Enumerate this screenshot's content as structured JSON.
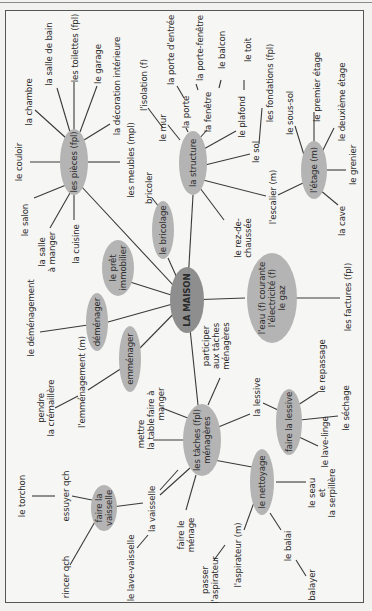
{
  "diagram": {
    "title": "LA MAISON",
    "orientation": "rotated -90deg (text reads bottom-to-top)",
    "colors": {
      "node_fill": "#b4b4b4",
      "center_fill": "#8e8e8e",
      "line": "#3a3a3a",
      "frame": "#555555"
    },
    "center": {
      "label": "LA MAISON",
      "x": 187,
      "y": 300
    },
    "nodes": [
      {
        "id": "pieces",
        "label": "les pièces (fpl)",
        "x": 74,
        "y": 162
      },
      {
        "id": "structure",
        "label": "la structure",
        "x": 193,
        "y": 163
      },
      {
        "id": "etage",
        "label": "l'étage (m)",
        "x": 314,
        "y": 170
      },
      {
        "id": "bricolage",
        "label": "le bricolage",
        "x": 163,
        "y": 230
      },
      {
        "id": "pret",
        "label": "le prêt\nimmobilier",
        "x": 118,
        "y": 268
      },
      {
        "id": "demenager",
        "label": "déménager",
        "x": 97,
        "y": 322
      },
      {
        "id": "emmenager",
        "label": "emménager",
        "x": 130,
        "y": 359
      },
      {
        "id": "eau",
        "label": "l'eau (f) courante\nl'électricité (f)\nle gaz",
        "x": 272,
        "y": 298
      },
      {
        "id": "taches",
        "label": "les tâches (fpl)\nménagères",
        "x": 202,
        "y": 440
      },
      {
        "id": "lessive",
        "label": "faire la lessive",
        "x": 289,
        "y": 422
      },
      {
        "id": "vaisselle",
        "label": "faire la\nvaisselle",
        "x": 104,
        "y": 508
      },
      {
        "id": "nettoyage",
        "label": "le nettoyage",
        "x": 262,
        "y": 482
      }
    ],
    "leaves": [
      {
        "parent": "pieces",
        "label": "le couloir",
        "x": 19,
        "y": 162
      },
      {
        "parent": "pieces",
        "label": "la chambre",
        "x": 29,
        "y": 102
      },
      {
        "parent": "pieces",
        "label": "la salle de bain",
        "x": 49,
        "y": 54
      },
      {
        "parent": "pieces",
        "label": "les toilettes (fpl)",
        "x": 75,
        "y": 48
      },
      {
        "parent": "pieces",
        "label": "le garage",
        "x": 98,
        "y": 64
      },
      {
        "parent": "pieces",
        "label": "la décoration intérieure",
        "x": 117,
        "y": 86
      },
      {
        "parent": "pieces",
        "label": "les meubles (mpl)",
        "x": 131,
        "y": 160
      },
      {
        "parent": "pieces",
        "label": "le salon",
        "x": 25,
        "y": 220
      },
      {
        "parent": "pieces",
        "label": "la salle\nà manger",
        "x": 47,
        "y": 252
      },
      {
        "parent": "pieces",
        "label": "la cuisine",
        "x": 76,
        "y": 244
      },
      {
        "parent": "structure",
        "label": "l'isolation (f)",
        "x": 144,
        "y": 85
      },
      {
        "parent": "structure",
        "label": "le mur",
        "x": 163,
        "y": 128
      },
      {
        "parent": "structure",
        "label": "la porte d'entrée",
        "x": 171,
        "y": 50
      },
      {
        "parent": "structure",
        "label": "la porte",
        "x": 186,
        "y": 110
      },
      {
        "parent": "structure",
        "label": "la porte-fenêtre",
        "x": 200,
        "y": 48
      },
      {
        "parent": "structure",
        "label": "la fenêtre",
        "x": 208,
        "y": 112
      },
      {
        "parent": "structure",
        "label": "le balcon",
        "x": 222,
        "y": 50
      },
      {
        "parent": "structure",
        "label": "le plafond",
        "x": 242,
        "y": 117
      },
      {
        "parent": "structure",
        "label": "le toit",
        "x": 248,
        "y": 50
      },
      {
        "parent": "structure",
        "label": "les fondations (fpl)",
        "x": 270,
        "y": 83
      },
      {
        "parent": "structure",
        "label": "le sol",
        "x": 256,
        "y": 152
      },
      {
        "parent": "structure",
        "label": "l'escalier (m)",
        "x": 273,
        "y": 197
      },
      {
        "parent": "structure",
        "label": "le rez-de-\nchaussée",
        "x": 243,
        "y": 238
      },
      {
        "parent": "bricolage",
        "label": "bricoler",
        "x": 149,
        "y": 188
      },
      {
        "parent": "etage",
        "label": "le sous-sol",
        "x": 290,
        "y": 113
      },
      {
        "parent": "etage",
        "label": "le premier étage",
        "x": 317,
        "y": 87
      },
      {
        "parent": "etage",
        "label": "le deuxième étage",
        "x": 342,
        "y": 102
      },
      {
        "parent": "etage",
        "label": "le grenier",
        "x": 353,
        "y": 165
      },
      {
        "parent": "etage",
        "label": "la cave",
        "x": 342,
        "y": 221
      },
      {
        "parent": "demenager",
        "label": "le déménagement",
        "x": 31,
        "y": 318
      },
      {
        "parent": "emmenager",
        "label": "l'emménagement (m)",
        "x": 82,
        "y": 382
      },
      {
        "parent": "emmenager",
        "label": "pendre\nla crémaillère",
        "x": 46,
        "y": 408
      },
      {
        "parent": "eau",
        "label": "les factures (fpl)",
        "x": 348,
        "y": 297
      },
      {
        "parent": "taches",
        "label": "participer\naux tâches\nménagères",
        "x": 216,
        "y": 346
      },
      {
        "parent": "taches",
        "label": "faire à\nmanger",
        "x": 156,
        "y": 404
      },
      {
        "parent": "taches",
        "label": "mettre\nla table",
        "x": 146,
        "y": 434
      },
      {
        "parent": "taches",
        "label": "la lessive",
        "x": 257,
        "y": 397
      },
      {
        "parent": "taches",
        "label": "faire le\nménage",
        "x": 186,
        "y": 535
      },
      {
        "parent": "lessive",
        "label": "le repassage",
        "x": 322,
        "y": 366
      },
      {
        "parent": "lessive",
        "label": "le séchage",
        "x": 346,
        "y": 408
      },
      {
        "parent": "lessive",
        "label": "le lave-linge",
        "x": 325,
        "y": 442
      },
      {
        "parent": "vaisselle",
        "label": "le torchon",
        "x": 22,
        "y": 496
      },
      {
        "parent": "vaisselle",
        "label": "essuyer qch",
        "x": 66,
        "y": 496
      },
      {
        "parent": "vaisselle",
        "label": "rincer qch",
        "x": 66,
        "y": 577
      },
      {
        "parent": "vaisselle",
        "label": "la vaisselle",
        "x": 152,
        "y": 509
      },
      {
        "parent": "vaisselle",
        "label": "le lave-vaisselle",
        "x": 131,
        "y": 568
      },
      {
        "parent": "nettoyage",
        "label": "le seau\net\nla serpillère",
        "x": 322,
        "y": 493
      },
      {
        "parent": "nettoyage",
        "label": "l'aspirateur (m)",
        "x": 238,
        "y": 555
      },
      {
        "parent": "nettoyage",
        "label": "passer\nl'aspirateur",
        "x": 210,
        "y": 580
      },
      {
        "parent": "nettoyage",
        "label": "le balai",
        "x": 288,
        "y": 546
      },
      {
        "parent": "nettoyage",
        "label": "balayer",
        "x": 312,
        "y": 585
      }
    ]
  },
  "labels": {
    "center": "LA MAISON",
    "pieces": "les pièces (fpl)",
    "structure": "la structure",
    "etage": "l'étage (m)",
    "bricolage": "le bricolage",
    "pret": "le prêt\nimmobilier",
    "demenager": "déménager",
    "emmenager": "emménager",
    "eau": "l'eau (f) courante\nl'électricité (f)\nle gaz",
    "taches": "les tâches (fpl)\nménagères",
    "lessive": "faire la lessive",
    "vaisselle": "faire la\nvaisselle",
    "nettoyage": "le nettoyage",
    "couloir": "le couloir",
    "chambre": "la chambre",
    "salle_bain": "la salle de bain",
    "toilettes": "les toilettes (fpl)",
    "garage": "le garage",
    "decoration": "la décoration intérieure",
    "meubles": "les meubles (mpl)",
    "salon": "le salon",
    "salle_manger": "la salle\nà manger",
    "cuisine": "la cuisine",
    "isolation": "l'isolation (f)",
    "mur": "le mur",
    "porte_entree": "la porte d'entrée",
    "porte": "la porte",
    "porte_fenetre": "la porte-fenêtre",
    "fenetre": "la fenêtre",
    "balcon": "le balcon",
    "plafond": "le plafond",
    "toit": "le toit",
    "fondations": "les fondations (fpl)",
    "sol": "le sol",
    "escalier": "l'escalier (m)",
    "rez": "le rez-de-\nchaussée",
    "bricoler": "bricoler",
    "sous_sol": "le sous-sol",
    "premier": "le premier étage",
    "deuxieme": "le deuxième étage",
    "grenier": "le grenier",
    "cave": "la cave",
    "demenagement": "le déménagement",
    "emmenagement": "l'emménagement (m)",
    "cremaillere": "pendre\nla crémaillère",
    "factures": "les factures (fpl)",
    "participer": "participer\naux tâches\nménagères",
    "faire_manger": "faire à\nmanger",
    "mettre_table": "mettre\nla table",
    "la_lessive": "la lessive",
    "faire_menage": "faire le\nménage",
    "repassage": "le repassage",
    "sechage": "le séchage",
    "lave_linge": "le lave-linge",
    "torchon": "le torchon",
    "essuyer": "essuyer qch",
    "rincer": "rincer qch",
    "la_vaisselle": "la vaisselle",
    "lave_vaisselle": "le lave-vaisselle",
    "seau": "le seau\net\nla serpillère",
    "aspirateur": "l'aspirateur (m)",
    "passer_aspirateur": "passer\nl'aspirateur",
    "balai": "le balai",
    "balayer": "balayer"
  }
}
